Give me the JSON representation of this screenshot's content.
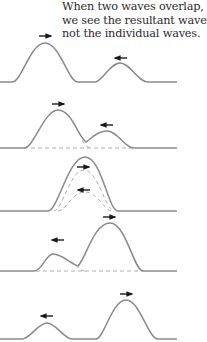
{
  "caption": {
    "lines": [
      "When two waves overlap,",
      "we see the resultant wave,",
      "not the individual waves."
    ]
  },
  "diagram": {
    "colors": {
      "wave": "#8a8a8a",
      "dashed": "#b0b0b0",
      "arrow": "#1a1a1a",
      "text": "#2b2b2b"
    },
    "panels": [
      {
        "id": 1,
        "description": "Large pulse moving right, small pulse moving left, separated",
        "arrows": [
          "right",
          "left"
        ]
      },
      {
        "id": 2,
        "description": "Pulses begin to overlap",
        "arrows": [
          "right",
          "left"
        ]
      },
      {
        "id": 3,
        "description": "Pulses fully overlapped, resultant wave shown",
        "arrows": [
          "right",
          "left"
        ]
      },
      {
        "id": 4,
        "description": "Pulses separating after passing",
        "arrows": [
          "left",
          "right"
        ]
      },
      {
        "id": 5,
        "description": "Pulses fully separated, small pulse left, large pulse right",
        "arrows": [
          "left",
          "right"
        ]
      }
    ]
  }
}
